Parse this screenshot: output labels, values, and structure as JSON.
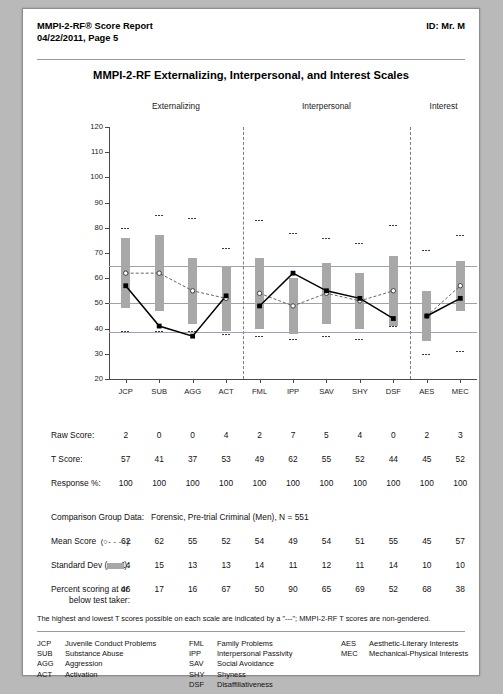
{
  "header": {
    "title_line1": "MMPI-2-RF® Score Report",
    "title_line2": "04/22/2011, Page 5",
    "id": "ID: Mr. M"
  },
  "chart_title": "MMPI-2-RF Externalizing, Interpersonal, and Interest Scales",
  "sections": [
    {
      "label": "Externalizing"
    },
    {
      "label": "Interpersonal"
    },
    {
      "label": "Interest"
    }
  ],
  "rows": {
    "raw_score_label": "Raw Score:",
    "t_score_label": "T Score:",
    "response_label": "Response %:",
    "comparison_label": "Comparison Group Data:",
    "comparison_value": "Forensic, Pre-trial Criminal (Men), N = 551",
    "mean_label_a": "Mean Score",
    "mean_label_b": "(○- - -○):",
    "sd_label_a": "Standard Dev (",
    "sd_label_b": "):",
    "pct_label_line1": "Percent scoring at or",
    "pct_label_line2": "below test taker:"
  },
  "footnote": "The highest and lowest T scores possible on each scale are indicated by a \"---\"; MMPI-2-RF T scores are non-gendered.",
  "abbreviations": {
    "col1": [
      {
        "code": "JCP",
        "name": "Juvenile Conduct Problems"
      },
      {
        "code": "SUB",
        "name": "Substance Abuse"
      },
      {
        "code": "AGG",
        "name": "Aggression"
      },
      {
        "code": "ACT",
        "name": "Activation"
      }
    ],
    "col2": [
      {
        "code": "FML",
        "name": "Family Problems"
      },
      {
        "code": "IPP",
        "name": "Interpersonal Passivity"
      },
      {
        "code": "SAV",
        "name": "Social Avoidance"
      },
      {
        "code": "SHY",
        "name": "Shyness"
      },
      {
        "code": "DSF",
        "name": "Disaffiliativeness"
      }
    ],
    "col3": [
      {
        "code": "AES",
        "name": "Aesthetic-Literary Interests"
      },
      {
        "code": "MEC",
        "name": "Mechanical-Physical Interests"
      }
    ]
  },
  "colors": {
    "bar": "#a8a8a8",
    "gridline": "#9aa3b5",
    "axis": "#4a4a4a",
    "t_line": "#000000",
    "mean_line": "#555555",
    "page_bg": "#ffffff"
  },
  "chart_data": {
    "type": "line",
    "title": "MMPI-2-RF Externalizing, Interpersonal, and Interest Scales",
    "xlabel": "",
    "ylabel": "T Score",
    "ylim": [
      20,
      120
    ],
    "yticks": [
      20,
      30,
      40,
      50,
      60,
      70,
      80,
      90,
      100,
      110,
      120
    ],
    "grid": true,
    "gridlines_at": [
      65,
      50,
      38.5
    ],
    "legend_position": "below-table",
    "categories": [
      "JCP",
      "SUB",
      "AGG",
      "ACT",
      "FML",
      "IPP",
      "SAV",
      "SHY",
      "DSF",
      "AES",
      "MEC"
    ],
    "section_breaks": [
      4,
      9
    ],
    "series": [
      {
        "name": "T Score",
        "marker": "filled-square",
        "line": "solid",
        "values": [
          57,
          41,
          37,
          53,
          49,
          62,
          55,
          52,
          44,
          45,
          52
        ]
      },
      {
        "name": "Mean Score",
        "marker": "open-circle",
        "line": "dashed",
        "values": [
          62,
          62,
          55,
          52,
          54,
          49,
          54,
          51,
          55,
          45,
          57
        ]
      }
    ],
    "standard_dev": [
      14,
      15,
      13,
      13,
      14,
      11,
      12,
      11,
      14,
      10,
      10
    ],
    "raw_scores": [
      2,
      0,
      0,
      4,
      2,
      7,
      5,
      4,
      0,
      2,
      3
    ],
    "response_pct": [
      100,
      100,
      100,
      100,
      100,
      100,
      100,
      100,
      100,
      100,
      100
    ],
    "percent_at_or_below": [
      46,
      17,
      16,
      67,
      50,
      90,
      65,
      69,
      52,
      68,
      38
    ],
    "t_min": [
      39,
      39,
      39,
      38,
      37,
      36,
      37,
      36,
      41,
      30,
      31
    ],
    "t_max": [
      80,
      85,
      84,
      72,
      83,
      78,
      76,
      74,
      81,
      71,
      77
    ]
  }
}
